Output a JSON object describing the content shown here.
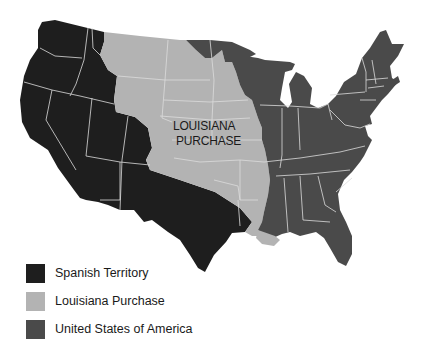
{
  "map": {
    "label_line1": "LOUISIANA",
    "label_line2": "PURCHASE",
    "colors": {
      "spanish": "#1e1e1e",
      "louisiana": "#b3b3b3",
      "usa": "#4a4a4a",
      "border": "#dcdcdc",
      "background": "#ffffff"
    }
  },
  "legend": {
    "items": [
      {
        "label": "Spanish Territory",
        "color": "#1e1e1e"
      },
      {
        "label": "Louisiana Purchase",
        "color": "#b3b3b3"
      },
      {
        "label": "United States of America",
        "color": "#4a4a4a"
      }
    ]
  }
}
